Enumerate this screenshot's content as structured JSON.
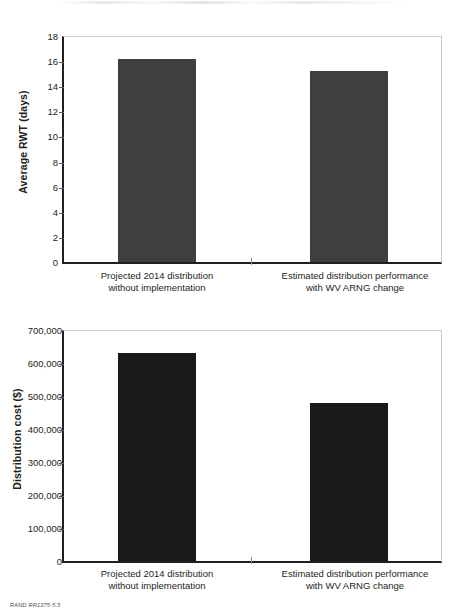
{
  "footer": {
    "org": "RAND",
    "figure_code": "RR1375-5.5"
  },
  "categories": [
    {
      "line1": "Projected 2014 distribution",
      "line2": "without implementation"
    },
    {
      "line1": "Estimated distribution performance",
      "line2": "with WV ARNG change"
    }
  ],
  "colors": {
    "bar_top": "#3f3f3f",
    "bar_bottom": "#1a1a1a",
    "axis": "#231f20",
    "frame": "#c9c9c9"
  },
  "chart_data": [
    {
      "type": "bar",
      "title": "",
      "xlabel": "",
      "ylabel": "Average RWT (days)",
      "categories": [
        "Projected 2014 distribution without implementation",
        "Estimated distribution performance with WV ARNG change"
      ],
      "values": [
        16.2,
        15.2
      ],
      "ylim": [
        0,
        18
      ],
      "yticks": [
        0,
        2,
        4,
        6,
        8,
        10,
        12,
        14,
        16,
        18
      ],
      "ytick_labels": [
        "0",
        "2",
        "4",
        "6",
        "8",
        "10",
        "12",
        "14",
        "16",
        "18"
      ],
      "grid": false,
      "legend": "none"
    },
    {
      "type": "bar",
      "title": "",
      "xlabel": "",
      "ylabel": "Distribution cost ($)",
      "categories": [
        "Projected 2014 distribution without implementation",
        "Estimated distribution performance with WV ARNG change"
      ],
      "values": [
        630000,
        480000
      ],
      "ylim": [
        0,
        700000
      ],
      "yticks": [
        0,
        100000,
        200000,
        300000,
        400000,
        500000,
        600000,
        700000
      ],
      "ytick_labels": [
        "0",
        "100,000",
        "200,000",
        "300,000",
        "400,000",
        "500,000",
        "600,000",
        "700,000"
      ],
      "grid": false,
      "legend": "none"
    }
  ]
}
